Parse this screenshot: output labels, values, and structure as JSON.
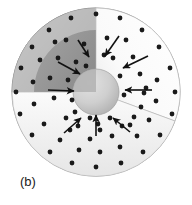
{
  "figure": {
    "caption_label": "(b)",
    "background_color": "#ffffff"
  },
  "geometry": {
    "center_x": 96,
    "center_y": 92,
    "outer_radius": 84,
    "shell_inner_radius": 62,
    "core_radius": 23,
    "wedge_start_angle_deg": -90,
    "wedge_end_angle_deg": 20
  },
  "colors": {
    "outer_shell_light": "#e8e8e8",
    "outer_shell_mid": "#c9c9c9",
    "outer_shell_dark": "#a8a8a8",
    "outer_shell_edge": "#9a9a9a",
    "cut_face_left": "#9e9e9e",
    "cut_face_right": "#fdfdfd",
    "cut_face_bottom": "#f2f2f2",
    "core_fill": "#cdcdcd",
    "core_shadow": "#b4b4b4",
    "dot_color": "#1a1a1a",
    "arrow_color": "#111111",
    "outline": "#8f8f8f"
  },
  "dots": {
    "radius": 2.4,
    "outer_surface_points": [
      {
        "x": 96,
        "y": 14
      },
      {
        "x": 71,
        "y": 18
      },
      {
        "x": 120,
        "y": 18
      },
      {
        "x": 49,
        "y": 30
      },
      {
        "x": 142,
        "y": 30
      },
      {
        "x": 32,
        "y": 47
      },
      {
        "x": 159,
        "y": 47
      },
      {
        "x": 21,
        "y": 68
      },
      {
        "x": 170,
        "y": 68
      },
      {
        "x": 16,
        "y": 92
      },
      {
        "x": 175,
        "y": 92
      },
      {
        "x": 20,
        "y": 114
      },
      {
        "x": 172,
        "y": 114
      },
      {
        "x": 32,
        "y": 135
      },
      {
        "x": 160,
        "y": 135
      },
      {
        "x": 50,
        "y": 152
      },
      {
        "x": 143,
        "y": 152
      },
      {
        "x": 72,
        "y": 163
      },
      {
        "x": 121,
        "y": 163
      },
      {
        "x": 96,
        "y": 167
      }
    ],
    "shell_body_points": [
      {
        "x": 55,
        "y": 42
      },
      {
        "x": 40,
        "y": 60
      },
      {
        "x": 33,
        "y": 82
      },
      {
        "x": 34,
        "y": 104
      },
      {
        "x": 44,
        "y": 124
      },
      {
        "x": 60,
        "y": 140
      },
      {
        "x": 79,
        "y": 150
      },
      {
        "x": 100,
        "y": 152
      },
      {
        "x": 120,
        "y": 147
      },
      {
        "x": 137,
        "y": 136
      },
      {
        "x": 149,
        "y": 120
      },
      {
        "x": 156,
        "y": 101
      },
      {
        "x": 157,
        "y": 80
      },
      {
        "x": 70,
        "y": 130
      },
      {
        "x": 90,
        "y": 139
      },
      {
        "x": 112,
        "y": 136
      },
      {
        "x": 130,
        "y": 125
      },
      {
        "x": 141,
        "y": 107
      },
      {
        "x": 146,
        "y": 88
      },
      {
        "x": 75,
        "y": 112
      },
      {
        "x": 98,
        "y": 124
      }
    ],
    "left_face_points": [
      {
        "x": 66,
        "y": 40
      },
      {
        "x": 84,
        "y": 44
      },
      {
        "x": 58,
        "y": 58
      },
      {
        "x": 76,
        "y": 62
      },
      {
        "x": 50,
        "y": 78
      },
      {
        "x": 68,
        "y": 80
      },
      {
        "x": 54,
        "y": 98
      },
      {
        "x": 72,
        "y": 100
      },
      {
        "x": 86,
        "y": 66
      }
    ],
    "right_face_points": [
      {
        "x": 107,
        "y": 38
      },
      {
        "x": 126,
        "y": 40
      },
      {
        "x": 113,
        "y": 58
      },
      {
        "x": 133,
        "y": 57
      },
      {
        "x": 120,
        "y": 76
      },
      {
        "x": 140,
        "y": 74
      },
      {
        "x": 124,
        "y": 95
      },
      {
        "x": 144,
        "y": 93
      },
      {
        "x": 104,
        "y": 55
      }
    ],
    "bottom_face_points": [
      {
        "x": 78,
        "y": 126
      },
      {
        "x": 100,
        "y": 130
      },
      {
        "x": 122,
        "y": 126
      },
      {
        "x": 66,
        "y": 118
      },
      {
        "x": 134,
        "y": 117
      },
      {
        "x": 90,
        "y": 118
      },
      {
        "x": 110,
        "y": 118
      }
    ]
  },
  "arrows": {
    "stroke_width": 1.6,
    "head_size": 4.5,
    "left_face": [
      {
        "x1": 78,
        "y1": 40,
        "x2": 89,
        "y2": 57
      },
      {
        "x1": 58,
        "y1": 62,
        "x2": 80,
        "y2": 74
      },
      {
        "x1": 48,
        "y1": 90,
        "x2": 74,
        "y2": 91
      }
    ],
    "right_face": [
      {
        "x1": 119,
        "y1": 36,
        "x2": 105,
        "y2": 56
      },
      {
        "x1": 148,
        "y1": 56,
        "x2": 123,
        "y2": 68
      },
      {
        "x1": 152,
        "y1": 90,
        "x2": 125,
        "y2": 90
      }
    ],
    "bottom_face": [
      {
        "x1": 64,
        "y1": 133,
        "x2": 81,
        "y2": 118
      },
      {
        "x1": 96,
        "y1": 136,
        "x2": 96,
        "y2": 115
      },
      {
        "x1": 130,
        "y1": 132,
        "x2": 113,
        "y2": 118
      }
    ]
  },
  "caption": {
    "x": 20,
    "y": 186
  }
}
